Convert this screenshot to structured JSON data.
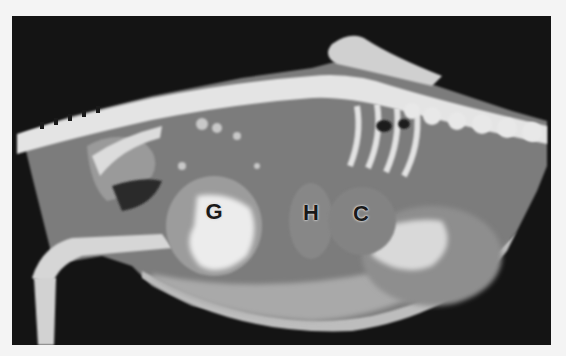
{
  "figure": {
    "labels": [
      {
        "text": "G",
        "x": 202,
        "y": 196
      },
      {
        "text": "H",
        "x": 299,
        "y": 197
      },
      {
        "text": "C",
        "x": 349,
        "y": 198
      }
    ],
    "colors": {
      "page_background": "#f4f4f4",
      "frame_background": "#141414",
      "bone": "#e6e6e6",
      "soft_tissue": "#8a8a8a",
      "label_text": "#1a1a1a"
    }
  }
}
